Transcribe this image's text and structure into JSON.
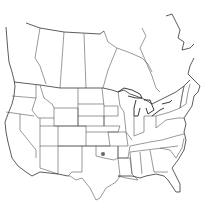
{
  "map": {
    "region": "North America (USA and southern Canada)",
    "style": "outline map of state and province borders",
    "colors": {
      "background": "#ffffff",
      "border": "#555555",
      "marker": "#666666"
    },
    "markers": [
      {
        "id": "occurrence-1",
        "location": "Oklahoma",
        "x": 103,
        "y": 154,
        "radius": 2
      }
    ]
  }
}
